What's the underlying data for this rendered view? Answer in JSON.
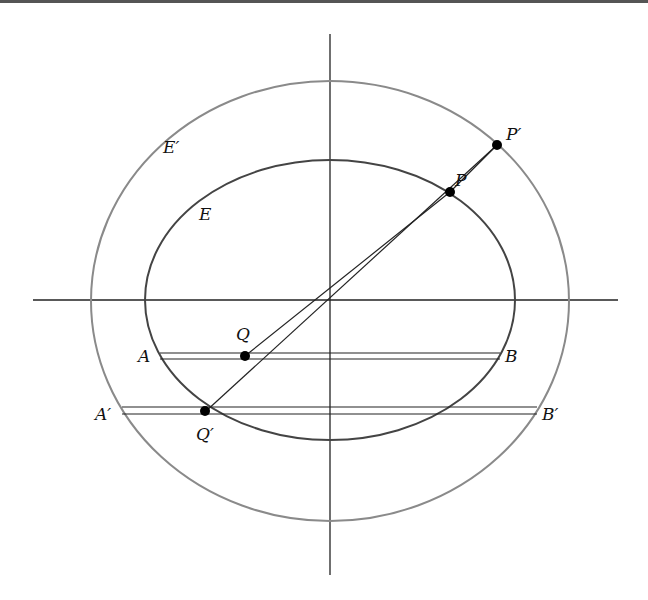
{
  "diagram": {
    "labels": {
      "E_outer": "E′",
      "E_inner": "E",
      "P": "P",
      "P_prime": "P′",
      "Q": "Q",
      "Q_prime": "Q′",
      "A": "A",
      "B": "B",
      "A_prime": "A′",
      "B_prime": "B′"
    },
    "colors": {
      "outer_ellipse": "#8a8a8a",
      "inner_ellipse": "#444444",
      "axes": "#222222",
      "points": "#000000"
    }
  }
}
